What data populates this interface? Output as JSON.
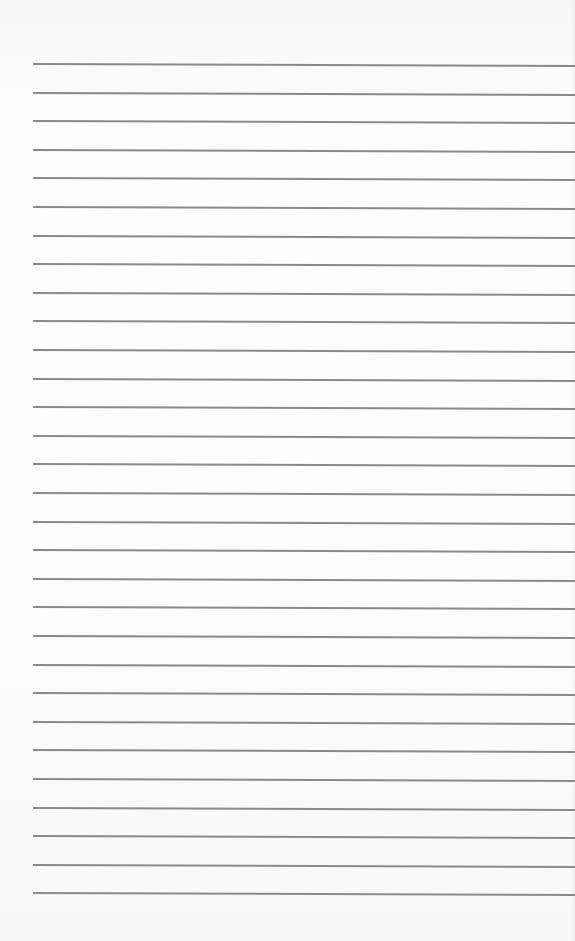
{
  "document": {
    "type": "lined-paper",
    "line_count": 30,
    "first_line_y": 63,
    "line_spacing": 28.6,
    "line_left": 33,
    "line_color": "#8a8a8a",
    "paper_color": "#fbfbfb"
  }
}
